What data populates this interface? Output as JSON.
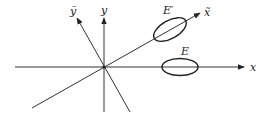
{
  "diagram": {
    "axes": {
      "x": {
        "label": "x"
      },
      "y": {
        "label": "y"
      },
      "x_tilde": {
        "label": "x̃"
      },
      "y_tilde": {
        "label": "ỹ"
      }
    },
    "ellipses": {
      "original": {
        "label": "E"
      },
      "transformed": {
        "label": "E′"
      }
    },
    "colors": {
      "stroke": "#222222",
      "background": "#ffffff"
    }
  }
}
